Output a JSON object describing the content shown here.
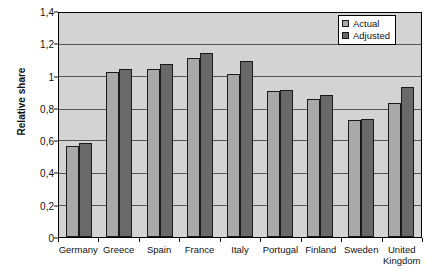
{
  "chart_data": {
    "type": "bar",
    "title": "",
    "xlabel": "",
    "ylabel": "Relative share",
    "ylim": [
      0,
      1.4
    ],
    "ytick_labels": [
      "0",
      "0,2",
      "0,4",
      "0,6",
      "0,8",
      "1",
      "1,2",
      "1,4"
    ],
    "ytick_values": [
      0,
      0.2,
      0.4,
      0.6,
      0.8,
      1.0,
      1.2,
      1.4
    ],
    "grid": true,
    "legend_position": "top-right",
    "categories": [
      "Germany",
      "Greece",
      "Spain",
      "France",
      "Italy",
      "Portugal",
      "Finland",
      "Sweden",
      "United Kingdom"
    ],
    "series": [
      {
        "name": "Actual",
        "color": "#a9a9a9",
        "values": [
          0.57,
          1.03,
          1.05,
          1.12,
          1.02,
          0.91,
          0.86,
          0.73,
          0.84
        ]
      },
      {
        "name": "Adjusted",
        "color": "#696969",
        "values": [
          0.59,
          1.05,
          1.08,
          1.15,
          1.1,
          0.92,
          0.89,
          0.74,
          0.94
        ]
      }
    ]
  },
  "legend": {
    "items": [
      {
        "label": "Actual",
        "swatch": "actual"
      },
      {
        "label": "Adjusted",
        "swatch": "adjusted"
      }
    ]
  }
}
